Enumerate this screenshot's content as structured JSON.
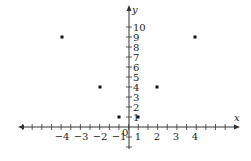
{
  "chart_data": {
    "type": "scatter",
    "title": "",
    "xlabel": "x",
    "ylabel": "y",
    "x_tick_labels": [
      "-4",
      "-3",
      "-2",
      "-1",
      "1",
      "2",
      "3",
      "4"
    ],
    "y_tick_labels": [
      "1",
      "2",
      "3",
      "4",
      "5",
      "6",
      "7",
      "8",
      "9",
      "10"
    ],
    "origin_label": "0",
    "points": [
      {
        "x": -4,
        "y": 9
      },
      {
        "x": -2,
        "y": 4
      },
      {
        "x": -1,
        "y": 1
      },
      {
        "x": 1,
        "y": 1
      },
      {
        "x": 2,
        "y": 4
      },
      {
        "x": 4,
        "y": 9
      }
    ],
    "xlim": [
      -6,
      6
    ],
    "ylim": [
      -2,
      12
    ],
    "grid": false,
    "colors": {
      "axis": "#333333",
      "points": "#111111",
      "text": "#222222"
    }
  }
}
